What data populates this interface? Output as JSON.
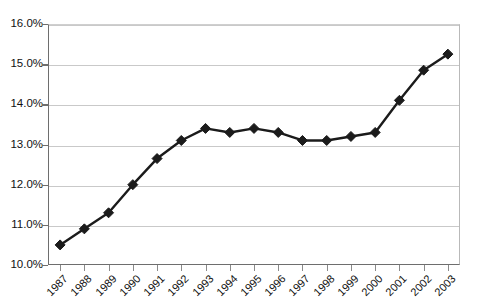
{
  "chart_data": {
    "type": "line",
    "title": "",
    "subtitle": "",
    "xlabel": "",
    "ylabel": "",
    "categories": [
      "1987",
      "1988",
      "1989",
      "1990",
      "1991",
      "1992",
      "1993",
      "1994",
      "1995",
      "1996",
      "1997",
      "1998",
      "1999",
      "2000",
      "2001",
      "2002",
      "2003"
    ],
    "values": [
      10.5,
      10.9,
      11.3,
      12.0,
      12.65,
      13.1,
      13.4,
      13.3,
      13.4,
      13.3,
      13.1,
      13.1,
      13.2,
      13.3,
      14.1,
      14.85,
      15.25
    ],
    "series": [
      {
        "name": "",
        "values": [
          10.5,
          10.9,
          11.3,
          12.0,
          12.65,
          13.1,
          13.4,
          13.3,
          13.4,
          13.3,
          13.1,
          13.1,
          13.2,
          13.3,
          14.1,
          14.85,
          15.25
        ]
      }
    ],
    "ylim": [
      10.0,
      16.0
    ],
    "ytick_labels": [
      "10.0%",
      "11.0%",
      "12.0%",
      "13.0%",
      "14.0%",
      "15.0%",
      "16.0%"
    ],
    "ytick_values": [
      10.0,
      11.0,
      12.0,
      13.0,
      14.0,
      15.0,
      16.0
    ],
    "xtick_labels": [
      "1987",
      "1988",
      "1989",
      "1990",
      "1991",
      "1992",
      "1993",
      "1994",
      "1995",
      "1996",
      "1997",
      "1998",
      "1999",
      "2000",
      "2001",
      "2002",
      "2003"
    ],
    "grid": true,
    "grid_axis": "y",
    "legend": false,
    "legend_position": "none",
    "value_format": "percent",
    "marker": "diamond",
    "colors": {
      "line": "#1b1b1b",
      "marker": "#1b1b1b",
      "grid": "#c9c9c9",
      "axis": "#6e6e6e",
      "background": "#ffffff",
      "text": "#111111"
    }
  }
}
